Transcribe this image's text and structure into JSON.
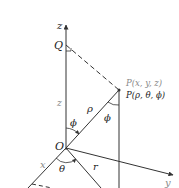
{
  "diagram": {
    "axes": {
      "z_label": "z",
      "y_label": "y",
      "x_label": "x"
    },
    "points": {
      "origin_label": "O",
      "q_label": "Q",
      "p_cartesian_label": "P(x, y, z)",
      "p_spherical_label": "P(ρ, θ, ϕ)"
    },
    "segments": {
      "rho_label": "ρ",
      "r_label": "r",
      "z_height_label": "z"
    },
    "angles": {
      "phi_at_origin_label": "ϕ",
      "phi_at_p_label": "ϕ",
      "theta_label": "θ"
    },
    "colors": {
      "line": "#333333",
      "text": "#222222",
      "muted_text": "#888888"
    }
  }
}
